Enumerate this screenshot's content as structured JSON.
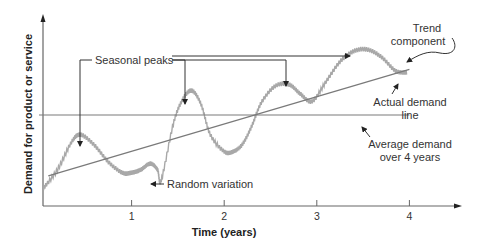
{
  "chart_data": {
    "type": "line",
    "title": "",
    "xlabel": "Time (years)",
    "ylabel": "Demand for product or service",
    "xlim": [
      0,
      4.5
    ],
    "ylim": [
      0,
      10
    ],
    "x_ticks": [
      1,
      2,
      3,
      4
    ],
    "x_tick_labels": [
      "1",
      "2",
      "3",
      "4"
    ],
    "grid": false,
    "series": [
      {
        "name": "Actual demand line",
        "color": "#a8a8a8",
        "x": [
          0.05,
          0.2,
          0.35,
          0.45,
          0.6,
          0.75,
          0.9,
          1.0,
          1.1,
          1.2,
          1.28,
          1.32,
          1.45,
          1.55,
          1.65,
          1.75,
          1.85,
          2.0,
          2.1,
          2.2,
          2.3,
          2.4,
          2.55,
          2.7,
          2.82,
          2.95,
          3.1,
          3.25,
          3.4,
          3.55,
          3.7,
          3.85,
          3.97
        ],
        "y": [
          0.4,
          1.6,
          3.4,
          3.9,
          3.2,
          2.1,
          1.4,
          1.4,
          1.6,
          2.0,
          1.6,
          0.9,
          4.6,
          6.2,
          6.8,
          5.9,
          3.9,
          2.8,
          2.8,
          3.3,
          4.5,
          6.0,
          7.1,
          7.2,
          6.6,
          6.1,
          7.4,
          8.7,
          9.4,
          9.5,
          9.0,
          8.1,
          8.0
        ]
      },
      {
        "name": "Trend component",
        "color": "#7a7a7a",
        "x": [
          0.1,
          4.0
        ],
        "y": [
          1.2,
          8.2
        ]
      },
      {
        "name": "Average demand over 4 years",
        "color": "#7a7a7a",
        "x": [
          0.0,
          4.0
        ],
        "y": [
          5.2,
          5.2
        ]
      }
    ],
    "annotations": [
      {
        "text": "Seasonal peaks",
        "points_to": [
          [
            0.45,
            3.9
          ],
          [
            1.6,
            6.8
          ],
          [
            2.65,
            7.2
          ],
          [
            3.45,
            9.5
          ]
        ]
      },
      {
        "text": "Random variation",
        "points_to": [
          [
            1.3,
            0.9
          ]
        ]
      },
      {
        "text": "Trend component",
        "points_to": [
          [
            3.9,
            8.1
          ]
        ]
      },
      {
        "text": "Actual demand line",
        "points_to": [
          [
            3.85,
            8.0
          ]
        ]
      },
      {
        "text": "Average demand over 4 years",
        "points_to": [
          [
            3.5,
            5.2
          ]
        ]
      }
    ]
  },
  "labels": {
    "seasonal_peaks": "Seasonal peaks",
    "random_variation": "Random variation",
    "trend_line1": "Trend",
    "trend_line2": "component",
    "actual_line1": "Actual demand",
    "actual_line2": "line",
    "average_line1": "Average demand",
    "average_line2": "over 4 years"
  }
}
